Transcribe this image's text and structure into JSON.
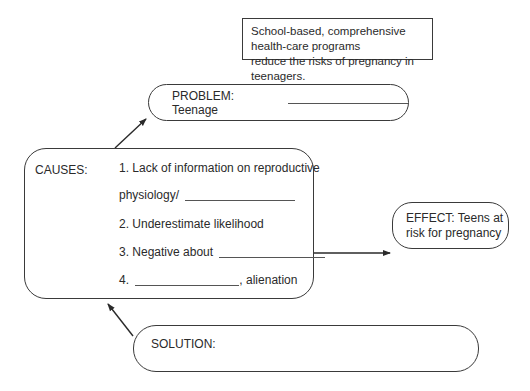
{
  "thesis": {
    "line1": "School-based, comprehensive health-care programs",
    "line2": "reduce the risks of pregnancy in teenagers."
  },
  "problem": {
    "label": "PROBLEM: Teenage"
  },
  "causes": {
    "title": "CAUSES:",
    "items": [
      {
        "line1": "1. Lack of information on reproductive",
        "line2": "physiology/"
      },
      {
        "text": "2. Underestimate likelihood"
      },
      {
        "text": "3. Negative about"
      },
      {
        "prefix": "4.",
        "suffix": ", alienation"
      }
    ]
  },
  "effect": {
    "line1": "EFFECT: Teens at",
    "line2": "risk for pregnancy"
  },
  "solution": {
    "label": "SOLUTION:"
  },
  "colors": {
    "stroke": "#3a3a3a",
    "text": "#2a2a2a",
    "background": "#ffffff"
  }
}
